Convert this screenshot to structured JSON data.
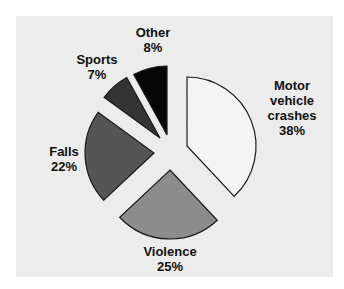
{
  "chart_data": {
    "type": "pie",
    "title": "",
    "style": "exploded",
    "categories": [
      "Motor vehicle crashes",
      "Violence",
      "Falls",
      "Sports",
      "Other"
    ],
    "values": [
      38,
      25,
      22,
      7,
      8
    ],
    "unit": "%",
    "legend": "none (direct labels)",
    "slices": [
      {
        "name": "Motor vehicle crashes",
        "value": 38,
        "label_lines": [
          "Motor",
          "vehicle",
          "crashes"
        ],
        "pct_label": "38%",
        "color": "#f4f4f4"
      },
      {
        "name": "Violence",
        "value": 25,
        "label_lines": [
          "Violence"
        ],
        "pct_label": "25%",
        "color": "#8c8c8c"
      },
      {
        "name": "Falls",
        "value": 22,
        "label_lines": [
          "Falls"
        ],
        "pct_label": "22%",
        "color": "#555555"
      },
      {
        "name": "Sports",
        "value": 7,
        "label_lines": [
          "Sports"
        ],
        "pct_label": "7%",
        "color": "#333333"
      },
      {
        "name": "Other",
        "value": 8,
        "label_lines": [
          "Other"
        ],
        "pct_label": "8%",
        "color": "#050505"
      }
    ]
  },
  "labels": {
    "motor": {
      "line1": "Motor",
      "line2": "vehicle",
      "line3": "crashes",
      "pct": "38%"
    },
    "violence": {
      "line1": "Violence",
      "pct": "25%"
    },
    "falls": {
      "line1": "Falls",
      "pct": "22%"
    },
    "sports": {
      "line1": "Sports",
      "pct": "7%"
    },
    "other": {
      "line1": "Other",
      "pct": "8%"
    }
  },
  "colors": {
    "panel_bg": "#ececec",
    "page_bg": "#ffffff",
    "outline": "#1a1a1a"
  }
}
